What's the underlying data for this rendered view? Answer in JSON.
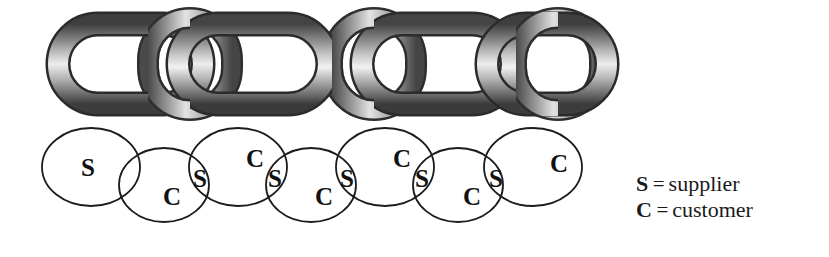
{
  "figure": {
    "chain": {
      "icon": "chain-links-icon",
      "link_count": 5,
      "colors": {
        "highlight": "#f2f2f2",
        "midtone": "#9a9a9a",
        "shadow": "#4a4a4a",
        "outline": "#2b2b2b"
      }
    },
    "ellipse_chain": {
      "stroke": "#1c1c1c",
      "fill": "#ffffff",
      "nodes": [
        {
          "id": "e1",
          "row": "upper",
          "cx": 91,
          "cy": 167,
          "rx": 49,
          "ry": 39,
          "labels": [
            {
              "text": "S",
              "x": 88,
              "y": 167
            }
          ]
        },
        {
          "id": "e2",
          "row": "lower",
          "cx": 164,
          "cy": 185,
          "rx": 45,
          "ry": 37,
          "labels": [
            {
              "text": "C",
              "x": 172,
              "y": 196
            }
          ]
        },
        {
          "id": "e3",
          "row": "upper",
          "cx": 238,
          "cy": 167,
          "rx": 49,
          "ry": 39,
          "labels": [
            {
              "text": "S",
              "x": 200,
              "y": 178
            },
            {
              "text": "C",
              "x": 255,
              "y": 158
            }
          ]
        },
        {
          "id": "e4",
          "row": "lower",
          "cx": 311,
          "cy": 185,
          "rx": 45,
          "ry": 37,
          "labels": [
            {
              "text": "S",
              "x": 275,
              "y": 178
            },
            {
              "text": "C",
              "x": 324,
              "y": 196
            }
          ]
        },
        {
          "id": "e5",
          "row": "upper",
          "cx": 385,
          "cy": 167,
          "rx": 49,
          "ry": 39,
          "labels": [
            {
              "text": "S",
              "x": 347,
              "y": 178
            },
            {
              "text": "C",
              "x": 402,
              "y": 158
            }
          ]
        },
        {
          "id": "e6",
          "row": "lower",
          "cx": 458,
          "cy": 185,
          "rx": 45,
          "ry": 37,
          "labels": [
            {
              "text": "S",
              "x": 422,
              "y": 178
            },
            {
              "text": "C",
              "x": 472,
              "y": 196
            }
          ]
        },
        {
          "id": "e7",
          "row": "upper",
          "cx": 533,
          "cy": 167,
          "rx": 49,
          "ry": 39,
          "labels": [
            {
              "text": "S",
              "x": 496,
              "y": 178
            },
            {
              "text": "C",
              "x": 559,
              "y": 163
            }
          ]
        }
      ]
    },
    "legend": {
      "items": [
        {
          "key": "S",
          "eq": "=",
          "value": "supplier"
        },
        {
          "key": "C",
          "eq": "=",
          "value": "customer"
        }
      ]
    }
  }
}
